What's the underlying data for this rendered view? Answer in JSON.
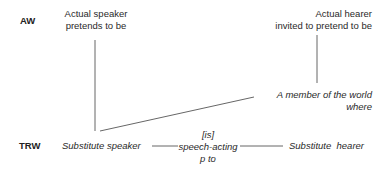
{
  "rows": {
    "aw_label": "AW",
    "trw_label": "TRW"
  },
  "actual_world": {
    "speaker": [
      "Actual speaker",
      "pretends to be"
    ],
    "hearer": [
      "Actual hearer",
      "invited to pretend to be"
    ]
  },
  "member": [
    "A member of the world",
    "where"
  ],
  "text_world": {
    "speaker": "Substitute speaker",
    "relation": [
      "[is]",
      "speech-acting",
      "p to"
    ],
    "hearer": "Substitute  hearer"
  }
}
